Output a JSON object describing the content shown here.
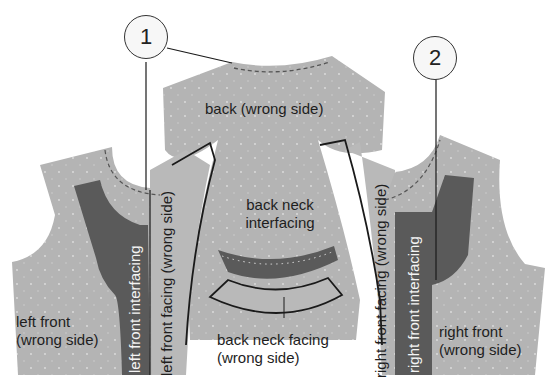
{
  "diagram": {
    "title": "",
    "colors": {
      "fabric": "#b4b4b4",
      "interfacing": "#5a5a5a",
      "outline": "#1a1a1a",
      "background": "#ffffff"
    },
    "callouts": [
      {
        "id": "1",
        "label": "1"
      },
      {
        "id": "2",
        "label": "2"
      }
    ],
    "pieces": {
      "back": {
        "label": "back (wrong side)"
      },
      "back_neck_interfacing": {
        "line1": "back neck",
        "line2": "interfacing"
      },
      "back_neck_facing": {
        "line1": "back neck facing",
        "line2": "(wrong side)"
      },
      "left_front": {
        "line1": "left front",
        "line2": "(wrong side)"
      },
      "right_front": {
        "line1": "right front",
        "line2": "(wrong side)"
      },
      "left_front_interfacing": {
        "label": "left front interfacing"
      },
      "left_front_facing": {
        "label": "left front facing (wrong side)"
      },
      "right_front_facing": {
        "label": "right front facing (wrong side)"
      },
      "right_front_interfacing": {
        "label": "right front interfacing"
      }
    }
  }
}
